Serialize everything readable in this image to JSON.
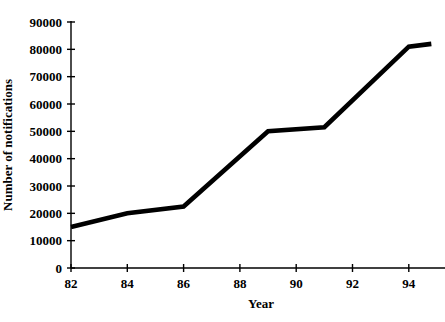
{
  "chart_data": {
    "type": "line",
    "title": "",
    "xlabel": "Year",
    "ylabel": "Number of notifications",
    "xlim": [
      82,
      95.5
    ],
    "ylim": [
      0,
      90000
    ],
    "grid": false,
    "legend": false,
    "x_ticks": [
      "82",
      "84",
      "86",
      "88",
      "90",
      "92",
      "94"
    ],
    "x_tick_values": [
      82,
      84,
      86,
      88,
      90,
      92,
      94
    ],
    "y_ticks": [
      "0",
      "10000",
      "20000",
      "30000",
      "40000",
      "50000",
      "60000",
      "70000",
      "80000",
      "90000"
    ],
    "y_tick_values": [
      0,
      10000,
      20000,
      30000,
      40000,
      50000,
      60000,
      70000,
      80000,
      90000
    ],
    "series": [
      {
        "name": "Notifications",
        "color": "#000000",
        "x": [
          82,
          84,
          86,
          89,
          91,
          94,
          94.8
        ],
        "values": [
          15000,
          20000,
          22500,
          50000,
          51500,
          81000,
          82000
        ]
      }
    ]
  },
  "axes": {
    "x_title": "Year",
    "y_title": "Number of notifications"
  }
}
